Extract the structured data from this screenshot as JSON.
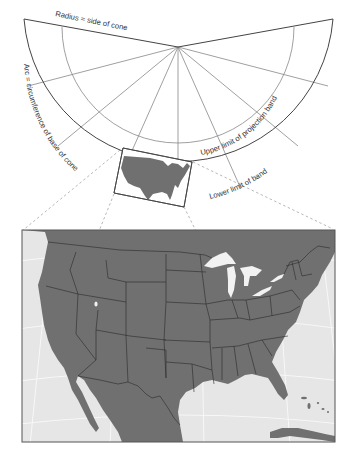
{
  "diagram": {
    "type": "conic-projection-development",
    "labels": {
      "radius": "Radius = side of cone",
      "arc": "Arc = circumference of base of cone",
      "upper_band": "Upper limit of projection band",
      "lower_band": "Lower limit of band"
    },
    "colors": {
      "background": "#ffffff",
      "line": "#555555",
      "grid_line": "#888888",
      "land": "#707070",
      "water": "#e6e6e6",
      "lake": "#f2f2f2",
      "border": "#2a2a2a",
      "graticule": "#fafafa",
      "dashed": "#b8b8b8"
    },
    "fan": {
      "apex": [
        178,
        47
      ],
      "outer_radius": 155,
      "inner_radius": 104,
      "mid_radius_label": "upper limit arc",
      "ray_count": 9
    },
    "inset_box": {
      "corners": [
        [
          123,
          148
        ],
        [
          192,
          162
        ],
        [
          184,
          207
        ],
        [
          114,
          193
        ]
      ]
    },
    "main_map": {
      "frame": {
        "x": 22,
        "y": 230,
        "width": 313,
        "height": 212
      },
      "region": "Contiguous United States with Mexico, Canada, Cuba, and Great Lakes"
    }
  }
}
